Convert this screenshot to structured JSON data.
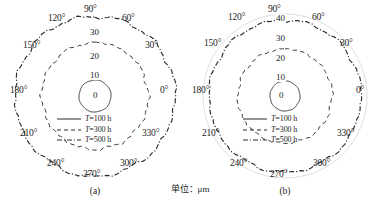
{
  "figure": {
    "unit_caption": "单位：μm",
    "background_color": "#ffffff",
    "line_color": "#2b2b2b",
    "guide_color": "#b9b9b9"
  },
  "panels": [
    {
      "id": "a",
      "caption": "(a)",
      "angle_labels": [
        "0°",
        "30°",
        "60°",
        "90°",
        "120°",
        "150°",
        "180°",
        "210°",
        "240°",
        "270°",
        "300°",
        "330°"
      ],
      "radial_labels": [
        "0",
        "10",
        "20",
        "30"
      ],
      "legend": [
        {
          "label_prefix": "T",
          "label_rest": "=100 h",
          "style": "solid"
        },
        {
          "label_prefix": "T",
          "label_rest": "=300 h",
          "style": "dashed"
        },
        {
          "label_prefix": "T",
          "label_rest": "=500 h",
          "style": "dashdot"
        }
      ]
    },
    {
      "id": "b",
      "caption": "(b)",
      "angle_labels": [
        "0°",
        "30°",
        "60°",
        "90°",
        "120°",
        "150°",
        "180°",
        "210°",
        "240°",
        "270°",
        "300°",
        "330°"
      ],
      "radial_labels": [
        "0",
        "10",
        "20",
        "30",
        "40"
      ],
      "legend": [
        {
          "label_prefix": "T",
          "label_rest": "=100 h",
          "style": "solid"
        },
        {
          "label_prefix": "T",
          "label_rest": "=300 h",
          "style": "dashed"
        },
        {
          "label_prefix": "T",
          "label_rest": "=500 h",
          "style": "dashdot"
        }
      ]
    }
  ],
  "chart_data": [
    {
      "type": "line",
      "title": "(a)",
      "projection": "polar",
      "xlabel": "角度 (°)",
      "ylabel": "单位：μm",
      "rlim": [
        0,
        30
      ],
      "rticks": [
        0,
        10,
        20,
        30
      ],
      "thetaticks": [
        0,
        30,
        60,
        90,
        120,
        150,
        180,
        210,
        240,
        270,
        300,
        330
      ],
      "grid": false,
      "legend_position": "center",
      "theta": [
        0,
        15,
        30,
        45,
        60,
        75,
        90,
        105,
        120,
        135,
        150,
        165,
        180,
        195,
        210,
        225,
        240,
        255,
        270,
        285,
        300,
        315,
        330,
        345
      ],
      "series": [
        {
          "name": "T=100 h",
          "style": "solid",
          "values": [
            6.0,
            6.1,
            6.0,
            5.9,
            6.0,
            6.1,
            6.0,
            5.9,
            6.0,
            6.1,
            6.0,
            5.9,
            6.0,
            6.1,
            6.0,
            5.9,
            6.0,
            6.1,
            6.0,
            5.9,
            6.0,
            6.1,
            6.0,
            5.9
          ]
        },
        {
          "name": "T=300 h",
          "style": "dashed",
          "values": [
            20.0,
            20.3,
            19.8,
            20.2,
            20.0,
            19.7,
            20.1,
            20.3,
            19.9,
            20.0,
            20.2,
            19.8,
            20.1,
            20.0,
            19.9,
            20.2,
            20.0,
            19.8,
            20.1,
            20.3,
            19.9,
            20.0,
            20.2,
            19.9
          ]
        },
        {
          "name": "T=500 h",
          "style": "dashdot",
          "values": [
            29.5,
            30.2,
            29.8,
            30.4,
            29.6,
            30.1,
            30.5,
            29.7,
            30.0,
            30.3,
            29.6,
            30.2,
            29.9,
            30.4,
            29.7,
            30.1,
            30.3,
            29.8,
            30.0,
            30.2,
            29.6,
            30.3,
            29.9,
            30.1
          ]
        }
      ]
    },
    {
      "type": "line",
      "title": "(b)",
      "projection": "polar",
      "xlabel": "角度 (°)",
      "ylabel": "单位：μm",
      "rlim": [
        0,
        40
      ],
      "rticks": [
        0,
        10,
        20,
        30,
        40
      ],
      "thetaticks": [
        0,
        30,
        60,
        90,
        120,
        150,
        180,
        210,
        240,
        270,
        300,
        330
      ],
      "grid": false,
      "legend_position": "center",
      "theta": [
        0,
        15,
        30,
        45,
        60,
        75,
        90,
        105,
        120,
        135,
        150,
        165,
        180,
        195,
        210,
        225,
        240,
        255,
        270,
        285,
        300,
        315,
        330,
        345
      ],
      "series": [
        {
          "name": "T=100 h",
          "style": "solid",
          "values": [
            7.5,
            7.6,
            7.4,
            7.5,
            7.6,
            7.4,
            7.5,
            7.6,
            7.4,
            7.5,
            7.6,
            7.4,
            7.5,
            7.6,
            7.4,
            7.5,
            7.6,
            7.4,
            7.5,
            7.6,
            7.4,
            7.5,
            7.6,
            7.4
          ]
        },
        {
          "name": "T=300 h",
          "style": "dashed",
          "values": [
            23.5,
            23.8,
            23.3,
            23.7,
            23.4,
            23.9,
            23.6,
            23.2,
            23.8,
            23.5,
            23.9,
            23.3,
            23.6,
            23.8,
            23.4,
            23.7,
            23.5,
            23.9,
            23.6,
            23.3,
            23.8,
            23.5,
            23.7,
            23.4
          ]
        },
        {
          "name": "T=500 h",
          "style": "dashdot",
          "values": [
            37.5,
            38.2,
            37.8,
            38.4,
            37.6,
            38.1,
            38.5,
            37.7,
            38.0,
            38.3,
            37.6,
            38.2,
            37.9,
            38.4,
            37.7,
            38.1,
            38.3,
            37.8,
            38.0,
            38.2,
            37.6,
            38.3,
            37.9,
            38.1
          ]
        }
      ]
    }
  ]
}
